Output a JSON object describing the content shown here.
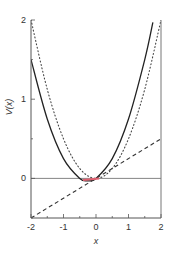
{
  "chart_data": {
    "type": "line",
    "title": "",
    "xlabel": "x",
    "ylabel": "V(x)",
    "xlim": [
      -2,
      2
    ],
    "ylim": [
      -0.5,
      2
    ],
    "xticks": [
      -2,
      -1,
      0,
      1,
      2
    ],
    "yticks": [
      0,
      1,
      2
    ],
    "xtick_labels": [
      "-2",
      "-1",
      "0",
      "1",
      "2"
    ],
    "ytick_labels": [
      "0",
      "1",
      "2"
    ],
    "grid": false,
    "legend": null,
    "reference_line": {
      "y": 0,
      "style": "solid-thin"
    },
    "series": [
      {
        "name": "solid",
        "style": "solid",
        "color": "#222222",
        "x": [
          -2,
          -1.5,
          -1,
          -0.5,
          -0.25,
          0,
          0.5,
          1,
          1.5,
          1.75
        ],
        "values": [
          1.5,
          0.75,
          0.25,
          0.0,
          -0.03,
          0.0,
          0.25,
          0.75,
          1.5,
          1.97
        ]
      },
      {
        "name": "dotted",
        "style": "dotted",
        "color": "#444444",
        "x": [
          -2,
          -1.5,
          -1,
          -0.5,
          0,
          0.5,
          1,
          1.5,
          2
        ],
        "values": [
          2.0,
          1.125,
          0.5,
          0.125,
          0.0,
          0.125,
          0.5,
          1.125,
          2.0
        ]
      },
      {
        "name": "dashed",
        "style": "dashed",
        "color": "#333333",
        "x": [
          -2,
          2
        ],
        "values": [
          -0.5,
          0.5
        ]
      },
      {
        "name": "highlight",
        "style": "solid",
        "color": "#e06070",
        "x": [
          -0.4,
          0.1
        ],
        "values": [
          -0.02,
          0.0
        ]
      }
    ]
  }
}
